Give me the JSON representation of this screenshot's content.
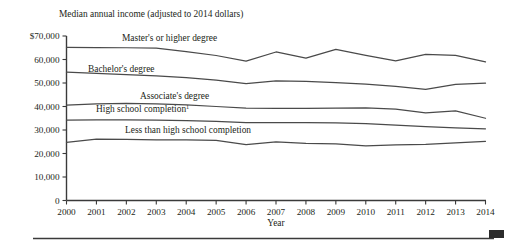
{
  "chart_data": {
    "type": "line",
    "title": "Median annual income (adjusted to 2014 dollars)",
    "xlabel": "Year",
    "ylabel": "",
    "xlim": [
      2000,
      2014
    ],
    "ylim": [
      0,
      70000
    ],
    "grid": false,
    "legend_position": "inline-labels",
    "x": [
      2000,
      2001,
      2002,
      2003,
      2004,
      2005,
      2006,
      2007,
      2008,
      2009,
      2010,
      2011,
      2012,
      2013,
      2014
    ],
    "y_ticks": [
      0,
      10000,
      20000,
      30000,
      40000,
      50000,
      60000,
      70000
    ],
    "y_tick_labels": [
      "0",
      "10,000",
      "20,000",
      "30,000",
      "40,000",
      "50,000",
      "60,000",
      "$70,000"
    ],
    "x_tick_labels": [
      "2000",
      "2001",
      "2002",
      "2003",
      "2004",
      "2005",
      "2006",
      "2007",
      "2008",
      "2009",
      "2010",
      "2011",
      "2012",
      "2013",
      "2014"
    ],
    "series": [
      {
        "name": "Master's or higher degree",
        "label": "Master's or higher degree",
        "label_superscript": "",
        "values": [
          65200,
          65100,
          65000,
          64800,
          63400,
          61700,
          59300,
          63200,
          60600,
          64300,
          61800,
          59400,
          62200,
          61800,
          59000
        ]
      },
      {
        "name": "Bachelor's degree",
        "label": "Bachelor's degree",
        "label_superscript": "",
        "values": [
          54600,
          54100,
          53600,
          53000,
          52300,
          51200,
          49700,
          50900,
          50700,
          50200,
          49500,
          48600,
          47300,
          49400,
          49900
        ]
      },
      {
        "name": "Associate's degree",
        "label": "Associate's degree",
        "label_superscript": "",
        "values": [
          40600,
          41100,
          41300,
          41100,
          40700,
          40000,
          39300,
          39200,
          39200,
          39300,
          39400,
          38900,
          37300,
          38100,
          35000
        ]
      },
      {
        "name": "High school completion",
        "label": "High school completion",
        "label_superscript": "1",
        "values": [
          34200,
          34300,
          34300,
          34200,
          34000,
          33700,
          33100,
          33100,
          33100,
          33000,
          32700,
          32100,
          31400,
          30900,
          30500
        ]
      },
      {
        "name": "Less than high school completion",
        "label": "Less than high school completion",
        "label_superscript": "",
        "values": [
          24700,
          26100,
          26000,
          25800,
          25800,
          25600,
          23800,
          24900,
          24300,
          24100,
          23200,
          23700,
          23900,
          24500,
          25200
        ]
      }
    ]
  },
  "footer": {
    "note_mark": ""
  }
}
